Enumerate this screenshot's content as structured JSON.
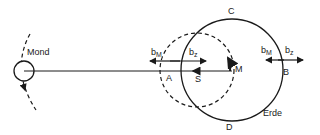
{
  "diagram": {
    "labels": {
      "moon": "Mond",
      "earth": "Erde",
      "point_c": "C",
      "point_d": "D",
      "point_a": "A",
      "point_b": "B",
      "point_s": "S",
      "point_m": "M",
      "b_left": "b",
      "b_left_sub": "M",
      "bz_left": "b",
      "bz_left_sub": "z",
      "b_right": "b",
      "b_right_sub": "M",
      "bz_right": "b",
      "bz_right_sub": "z"
    },
    "colors": {
      "stroke": "#1a1a1a",
      "background": "#ffffff"
    }
  }
}
